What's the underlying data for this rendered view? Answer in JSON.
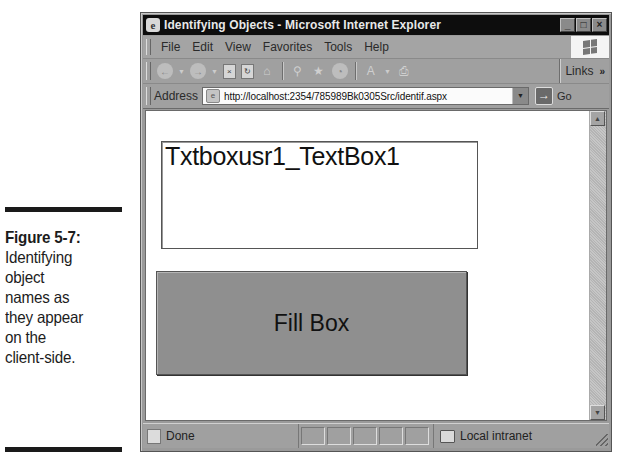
{
  "caption": {
    "label": "Figure 5-7:",
    "lines": [
      "Identifying",
      "object",
      "names as",
      "they appear",
      "on the",
      "client-side."
    ]
  },
  "window": {
    "title": "Identifying Objects - Microsoft Internet Explorer",
    "app_icon": "e",
    "controls": {
      "minimize": "_",
      "maximize": "□",
      "close": "×"
    }
  },
  "menubar": {
    "items": [
      "File",
      "Edit",
      "View",
      "Favorites",
      "Tools",
      "Help"
    ]
  },
  "toolbar": {
    "buttons": [
      {
        "name": "back-icon",
        "glyph": "←"
      },
      {
        "name": "forward-icon",
        "glyph": "→"
      },
      {
        "name": "stop-icon",
        "glyph": "×"
      },
      {
        "name": "refresh-icon",
        "glyph": "↻"
      },
      {
        "name": "home-icon",
        "glyph": "⌂"
      },
      {
        "name": "search-icon",
        "glyph": "⚲"
      },
      {
        "name": "favorites-icon",
        "glyph": "★"
      },
      {
        "name": "history-icon",
        "glyph": "◔"
      },
      {
        "name": "mail-icon",
        "glyph": "A"
      },
      {
        "name": "print-icon",
        "glyph": "⎙"
      }
    ],
    "links_label": "Links",
    "links_chevron": "»"
  },
  "addressbar": {
    "label": "Address",
    "url": "http://localhost:2354/785989Bk0305Src/identif.aspx",
    "go_label": "Go"
  },
  "page": {
    "textbox_value": "Txtboxusr1_TextBox1",
    "fill_button_label": "Fill Box"
  },
  "statusbar": {
    "status_text": "Done",
    "zone_text": "Local intranet"
  },
  "colors": {
    "titlebar": "#0d0d0d",
    "chrome": "#a0a0a0",
    "button_face": "#8f8f8f",
    "page_bg": "#ffffff"
  }
}
